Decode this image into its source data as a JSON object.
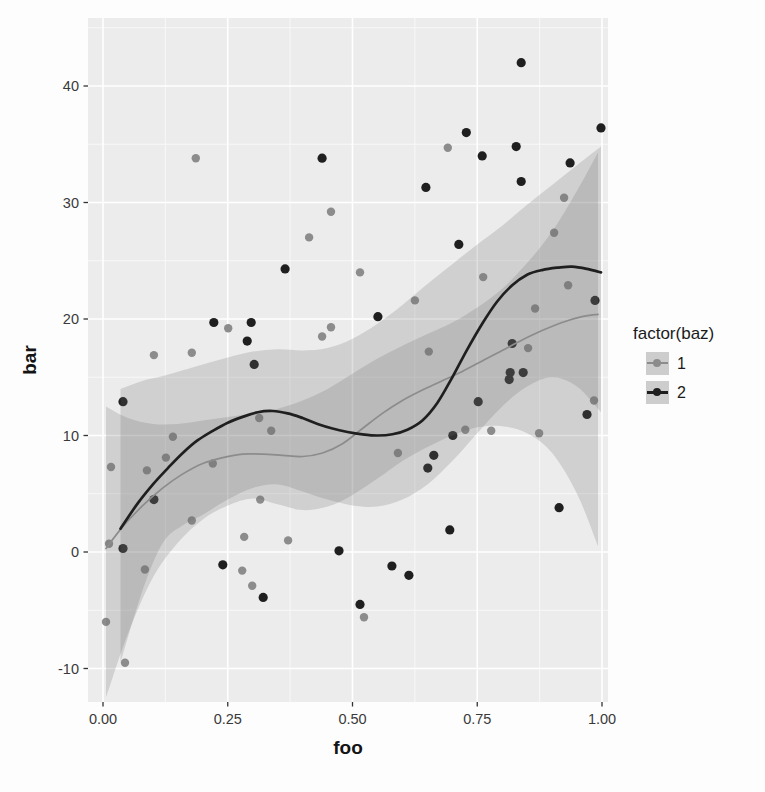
{
  "figure": {
    "panel_bg": "#ececec",
    "grid_major_color": "#ffffff",
    "grid_minor_color": "#f8f8f8",
    "tick_color": "#333333",
    "tick_label_color": "#3a3a3a",
    "ribbon_fill": "#6f6f6f",
    "ribbon_opacity": 0.22
  },
  "axes": {
    "x": {
      "title": "foo",
      "tick_labels": [
        "0.00",
        "0.25",
        "0.50",
        "0.75",
        "1.00"
      ],
      "tick_values": [
        0,
        0.25,
        0.5,
        0.75,
        1.0
      ],
      "minor_values": [
        0.125,
        0.375,
        0.625,
        0.875
      ]
    },
    "y": {
      "title": "bar",
      "tick_labels": [
        "-10",
        "0",
        "10",
        "20",
        "30",
        "40"
      ],
      "tick_values": [
        -10,
        0,
        10,
        20,
        30,
        40
      ],
      "minor_values": [
        -5,
        5,
        15,
        25,
        35,
        45
      ]
    }
  },
  "legend": {
    "title": "factor(baz)",
    "entries": [
      {
        "label": "1",
        "color": "#8c8c8c",
        "line_width": 2,
        "key_bg": "#cdcdcd"
      },
      {
        "label": "2",
        "color": "#1f1f1f",
        "line_width": 3,
        "key_bg": "#cdcdcd"
      }
    ]
  },
  "chart_data": {
    "type": "scatter",
    "title": "",
    "xlabel": "foo",
    "ylabel": "bar",
    "xlim": [
      -0.03,
      1.012
    ],
    "ylim": [
      -13,
      45.8
    ],
    "grid": true,
    "legend_position": "right",
    "legend_title": "factor(baz)",
    "series": [
      {
        "name": "1",
        "color": "#8c8c8c",
        "point_radius": 4.2,
        "line_width": 1.7,
        "points": [
          [
            0.186,
            33.8
          ],
          [
            0.457,
            29.2
          ],
          [
            0.413,
            27.0
          ],
          [
            0.691,
            34.7
          ],
          [
            0.251,
            19.2
          ],
          [
            0.457,
            19.3
          ],
          [
            0.439,
            18.5
          ],
          [
            0.515,
            24.0
          ],
          [
            0.625,
            21.6
          ],
          [
            0.924,
            30.4
          ],
          [
            0.904,
            27.4
          ],
          [
            0.932,
            22.9
          ],
          [
            0.866,
            20.9
          ],
          [
            0.762,
            23.6
          ],
          [
            0.102,
            16.9
          ],
          [
            0.178,
            17.1
          ],
          [
            0.313,
            11.5
          ],
          [
            0.337,
            10.4
          ],
          [
            0.14,
            9.9
          ],
          [
            0.126,
            8.1
          ],
          [
            0.016,
            7.3
          ],
          [
            0.088,
            7.0
          ],
          [
            0.22,
            7.6
          ],
          [
            0.315,
            4.5
          ],
          [
            0.178,
            2.7
          ],
          [
            0.084,
            -1.5
          ],
          [
            0.283,
            1.3
          ],
          [
            0.371,
            1.0
          ],
          [
            0.279,
            -1.6
          ],
          [
            0.299,
            -2.9
          ],
          [
            0.006,
            -6.0
          ],
          [
            0.044,
            -9.5
          ],
          [
            0.653,
            17.2
          ],
          [
            0.852,
            17.5
          ],
          [
            0.984,
            13.0
          ],
          [
            0.726,
            10.5
          ],
          [
            0.778,
            10.4
          ],
          [
            0.874,
            10.2
          ],
          [
            0.591,
            8.5
          ],
          [
            0.523,
            -5.6
          ],
          [
            0.012,
            0.7
          ]
        ],
        "smooth": [
          [
            0.006,
            0.3
          ],
          [
            0.04,
            2.2
          ],
          [
            0.08,
            4.0
          ],
          [
            0.12,
            5.5
          ],
          [
            0.16,
            6.7
          ],
          [
            0.2,
            7.6
          ],
          [
            0.24,
            8.1
          ],
          [
            0.28,
            8.4
          ],
          [
            0.32,
            8.4
          ],
          [
            0.36,
            8.3
          ],
          [
            0.4,
            8.2
          ],
          [
            0.44,
            8.5
          ],
          [
            0.48,
            9.3
          ],
          [
            0.52,
            10.6
          ],
          [
            0.56,
            11.9
          ],
          [
            0.6,
            13.0
          ],
          [
            0.64,
            13.9
          ],
          [
            0.68,
            14.7
          ],
          [
            0.72,
            15.5
          ],
          [
            0.76,
            16.4
          ],
          [
            0.8,
            17.3
          ],
          [
            0.84,
            18.2
          ],
          [
            0.88,
            19.0
          ],
          [
            0.92,
            19.7
          ],
          [
            0.96,
            20.2
          ],
          [
            0.992,
            20.4
          ]
        ],
        "ribbon": [
          [
            0.006,
            -12.5,
            12.5
          ],
          [
            0.05,
            -7.0,
            11.5
          ],
          [
            0.1,
            -2.2,
            11.0
          ],
          [
            0.15,
            0.8,
            11.0
          ],
          [
            0.2,
            2.8,
            11.3
          ],
          [
            0.25,
            4.0,
            11.6
          ],
          [
            0.3,
            4.6,
            11.9
          ],
          [
            0.35,
            4.1,
            12.3
          ],
          [
            0.4,
            3.6,
            13.0
          ],
          [
            0.45,
            3.9,
            14.0
          ],
          [
            0.5,
            4.9,
            15.3
          ],
          [
            0.55,
            6.3,
            16.6
          ],
          [
            0.6,
            7.8,
            17.7
          ],
          [
            0.65,
            9.0,
            18.7
          ],
          [
            0.7,
            10.0,
            19.7
          ],
          [
            0.75,
            10.7,
            21.0
          ],
          [
            0.8,
            10.8,
            22.6
          ],
          [
            0.85,
            10.2,
            24.8
          ],
          [
            0.9,
            8.5,
            27.5
          ],
          [
            0.95,
            5.0,
            31.0
          ],
          [
            0.992,
            0.5,
            34.3
          ]
        ]
      },
      {
        "name": "2",
        "color": "#1f1f1f",
        "point_radius": 4.6,
        "line_width": 2.7,
        "points": [
          [
            0.439,
            33.8
          ],
          [
            0.365,
            24.3
          ],
          [
            0.222,
            19.7
          ],
          [
            0.297,
            19.7
          ],
          [
            0.289,
            18.1
          ],
          [
            0.838,
            42.0
          ],
          [
            0.728,
            36.0
          ],
          [
            0.998,
            36.4
          ],
          [
            0.76,
            34.0
          ],
          [
            0.828,
            34.8
          ],
          [
            0.936,
            33.4
          ],
          [
            0.838,
            31.8
          ],
          [
            0.647,
            31.3
          ],
          [
            0.713,
            26.4
          ],
          [
            0.551,
            20.2
          ],
          [
            0.986,
            21.6
          ],
          [
            0.303,
            16.1
          ],
          [
            0.04,
            12.9
          ],
          [
            0.102,
            4.5
          ],
          [
            0.04,
            0.3
          ],
          [
            0.24,
            -1.1
          ],
          [
            0.321,
            -3.9
          ],
          [
            0.473,
            0.1
          ],
          [
            0.82,
            17.9
          ],
          [
            0.816,
            15.4
          ],
          [
            0.842,
            15.4
          ],
          [
            0.814,
            14.8
          ],
          [
            0.752,
            12.9
          ],
          [
            0.97,
            11.8
          ],
          [
            0.701,
            10.0
          ],
          [
            0.663,
            8.3
          ],
          [
            0.651,
            7.2
          ],
          [
            0.914,
            3.8
          ],
          [
            0.695,
            1.9
          ],
          [
            0.579,
            -1.2
          ],
          [
            0.613,
            -2.0
          ],
          [
            0.515,
            -4.5
          ]
        ],
        "smooth": [
          [
            0.035,
            2.0
          ],
          [
            0.07,
            4.2
          ],
          [
            0.1,
            5.8
          ],
          [
            0.13,
            7.2
          ],
          [
            0.16,
            8.5
          ],
          [
            0.19,
            9.6
          ],
          [
            0.22,
            10.4
          ],
          [
            0.25,
            11.1
          ],
          [
            0.28,
            11.6
          ],
          [
            0.31,
            12.0
          ],
          [
            0.34,
            12.1
          ],
          [
            0.37,
            11.9
          ],
          [
            0.4,
            11.5
          ],
          [
            0.43,
            11.0
          ],
          [
            0.46,
            10.6
          ],
          [
            0.49,
            10.3
          ],
          [
            0.52,
            10.1
          ],
          [
            0.55,
            10.0
          ],
          [
            0.58,
            10.1
          ],
          [
            0.61,
            10.5
          ],
          [
            0.64,
            11.3
          ],
          [
            0.67,
            12.8
          ],
          [
            0.7,
            15.0
          ],
          [
            0.73,
            17.4
          ],
          [
            0.76,
            19.6
          ],
          [
            0.79,
            21.5
          ],
          [
            0.82,
            22.9
          ],
          [
            0.85,
            23.8
          ],
          [
            0.88,
            24.2
          ],
          [
            0.91,
            24.4
          ],
          [
            0.94,
            24.5
          ],
          [
            0.97,
            24.3
          ],
          [
            0.998,
            24.0
          ]
        ],
        "ribbon": [
          [
            0.035,
            -9.5,
            14.0
          ],
          [
            0.08,
            -3.2,
            14.7
          ],
          [
            0.12,
            0.8,
            15.1
          ],
          [
            0.16,
            2.3,
            15.6
          ],
          [
            0.2,
            3.2,
            16.1
          ],
          [
            0.25,
            4.5,
            16.7
          ],
          [
            0.3,
            5.5,
            17.2
          ],
          [
            0.35,
            5.8,
            17.4
          ],
          [
            0.4,
            5.2,
            17.3
          ],
          [
            0.45,
            4.5,
            17.5
          ],
          [
            0.5,
            4.0,
            18.3
          ],
          [
            0.55,
            3.9,
            19.6
          ],
          [
            0.6,
            4.5,
            21.2
          ],
          [
            0.65,
            5.8,
            23.0
          ],
          [
            0.7,
            7.8,
            24.7
          ],
          [
            0.75,
            10.2,
            26.4
          ],
          [
            0.8,
            12.5,
            28.0
          ],
          [
            0.85,
            14.2,
            29.8
          ],
          [
            0.9,
            15.0,
            31.5
          ],
          [
            0.95,
            14.2,
            33.2
          ],
          [
            0.998,
            12.0,
            34.8
          ]
        ]
      }
    ]
  }
}
